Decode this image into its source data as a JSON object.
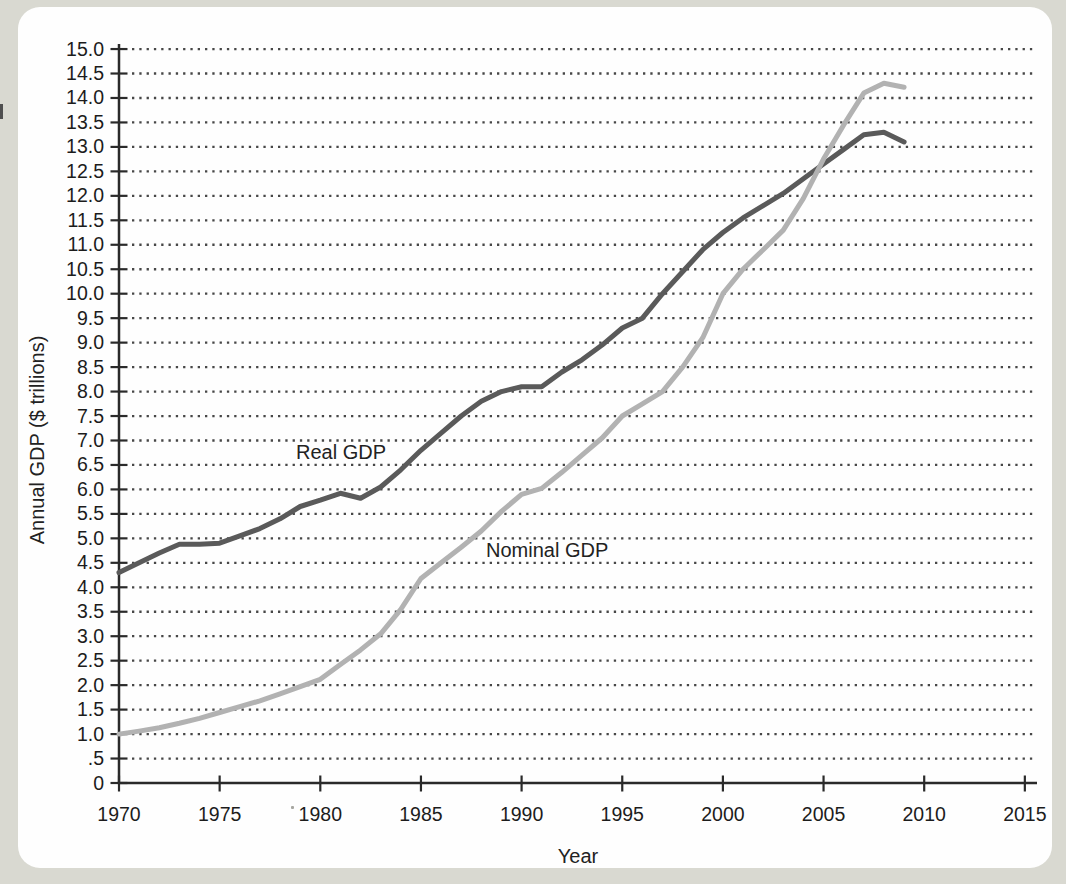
{
  "page": {
    "background_color": "#d9d9d1",
    "panel_color": "#fefefe"
  },
  "chart_data": {
    "type": "line",
    "title": "",
    "xlabel": "Year",
    "ylabel": "Annual GDP ($ trillions)",
    "x_range": [
      1970,
      2015
    ],
    "ylim": [
      0,
      15
    ],
    "grid": "dotted-horizontal",
    "legend_position": "inline-labels-on-lines",
    "axis_color": "#2a2a2a",
    "grid_dot_color": "#474747",
    "x_ticks": [
      1970,
      1975,
      1980,
      1985,
      1990,
      1995,
      2000,
      2005,
      2010,
      2015
    ],
    "y_tick_step": 0.5,
    "y_tick_labels": [
      "0",
      ".5",
      "1.0",
      "1.5",
      "2.0",
      "2.5",
      "3.0",
      "3.5",
      "4.0",
      "4.5",
      "5.0",
      "5.5",
      "6.0",
      "6.5",
      "7.0",
      "7.5",
      "8.0",
      "8.5",
      "9.0",
      "9.5",
      "10.0",
      "10.5",
      "11.0",
      "11.5",
      "12.0",
      "12.5",
      "13.0",
      "13.5",
      "14.0",
      "14.5",
      "15.0"
    ],
    "x": [
      1970,
      1971,
      1972,
      1973,
      1974,
      1975,
      1976,
      1977,
      1978,
      1979,
      1980,
      1981,
      1982,
      1983,
      1984,
      1985,
      1986,
      1987,
      1988,
      1989,
      1990,
      1991,
      1992,
      1993,
      1994,
      1995,
      1996,
      1997,
      1998,
      1999,
      2000,
      2001,
      2002,
      2003,
      2004,
      2005,
      2006,
      2007,
      2008,
      2009
    ],
    "series": [
      {
        "name": "Real GDP",
        "color": "#5a5a5a",
        "values": [
          4.3,
          4.5,
          4.7,
          4.88,
          4.88,
          4.9,
          5.05,
          5.2,
          5.4,
          5.65,
          5.78,
          5.92,
          5.82,
          6.05,
          6.4,
          6.8,
          7.15,
          7.5,
          7.8,
          8.0,
          8.1,
          8.1,
          8.4,
          8.65,
          8.95,
          9.3,
          9.5,
          10.0,
          10.45,
          10.9,
          11.25,
          11.55,
          11.8,
          12.05,
          12.35,
          12.65,
          12.95,
          13.25,
          13.3,
          13.1
        ]
      },
      {
        "name": "Nominal GDP",
        "color": "#b2b2b2",
        "values": [
          1.0,
          1.06,
          1.13,
          1.22,
          1.32,
          1.44,
          1.56,
          1.68,
          1.82,
          1.97,
          2.12,
          2.42,
          2.72,
          3.05,
          3.55,
          4.18,
          4.5,
          4.82,
          5.15,
          5.55,
          5.9,
          6.02,
          6.35,
          6.7,
          7.05,
          7.5,
          7.75,
          8.0,
          8.5,
          9.1,
          10.0,
          10.5,
          10.9,
          11.3,
          11.95,
          12.75,
          13.45,
          14.1,
          14.3,
          14.22
        ]
      }
    ]
  }
}
